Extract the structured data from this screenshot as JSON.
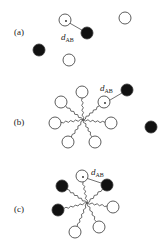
{
  "panels": [
    {
      "label": "(a)",
      "label_pos": [
        19,
        35
      ],
      "distance_label": "d",
      "distance_sub": "AB",
      "distance_label_pos": [
        61,
        40
      ],
      "distance_line": [
        [
          66,
          21
        ],
        [
          87,
          33
        ]
      ],
      "white": [
        [
          65,
          20
        ],
        [
          125,
          18
        ],
        [
          69,
          60
        ]
      ],
      "black": [
        [
          87,
          33
        ],
        [
          39,
          50
        ]
      ],
      "tethered": false
    },
    {
      "label": "(b)",
      "label_pos": [
        19,
        125
      ],
      "distance_label": "d",
      "distance_sub": "AB",
      "distance_label_pos": [
        100,
        91
      ],
      "distance_line": [
        [
          105,
          103
        ],
        [
          127,
          90
        ]
      ],
      "center": [
        83,
        120
      ],
      "white": [
        [
          82,
          92
        ],
        [
          61,
          102
        ],
        [
          104,
          102
        ],
        [
          55,
          123
        ],
        [
          111,
          123
        ],
        [
          68,
          142
        ],
        [
          95,
          142
        ]
      ],
      "black": [
        [
          127,
          90
        ],
        [
          151,
          127
        ]
      ],
      "tethered_nodes": "white"
    },
    {
      "label": "(c)",
      "label_pos": [
        19,
        212
      ],
      "distance_label": "d",
      "distance_sub": "AB",
      "distance_label_pos": [
        91,
        175
      ],
      "distance_line": [
        [
          83,
          177
        ],
        [
          107,
          185
        ]
      ],
      "center": [
        87,
        203
      ],
      "white": [
        [
          82,
          176
        ],
        [
          113,
          207
        ],
        [
          75,
          232
        ],
        [
          99,
          227
        ]
      ],
      "black": [
        [
          62,
          186
        ],
        [
          107,
          185
        ],
        [
          58,
          210
        ]
      ],
      "tethered_nodes": "all"
    }
  ],
  "style": {
    "radius": 6,
    "stroke": "#333333",
    "fill_black": "#111111",
    "fill_white": "#ffffff"
  }
}
